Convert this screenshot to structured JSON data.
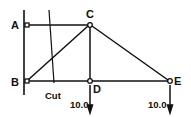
{
  "diagram": {
    "title": "",
    "nodes": [
      {
        "id": "A",
        "label": "A",
        "x": 27,
        "y": 25
      },
      {
        "id": "C",
        "label": "C",
        "x": 90,
        "y": 25
      },
      {
        "id": "B",
        "label": "B",
        "x": 27,
        "y": 81
      },
      {
        "id": "D",
        "label": "D",
        "x": 90,
        "y": 81
      },
      {
        "id": "E",
        "label": "E",
        "x": 170,
        "y": 81
      }
    ],
    "members": [
      {
        "from": "A",
        "to": "C"
      },
      {
        "from": "B",
        "to": "C"
      },
      {
        "from": "C",
        "to": "D"
      },
      {
        "from": "C",
        "to": "E"
      },
      {
        "from": "B",
        "to": "D"
      },
      {
        "from": "D",
        "to": "E"
      }
    ],
    "support": {
      "type": "wall",
      "x": 24,
      "y1": 10,
      "y2": 95
    },
    "cut": {
      "label": "Cut"
    },
    "loads": [
      {
        "at": "D",
        "value": "10.0"
      },
      {
        "at": "E",
        "value": "10.0"
      }
    ],
    "labels": {
      "A": "A",
      "B": "B",
      "C": "C",
      "D": "D",
      "E": "E",
      "cut": "Cut",
      "load_d": "10.0",
      "load_e": "10.0"
    },
    "colors": {
      "ink": "#111111",
      "background": "#ffffff"
    }
  }
}
